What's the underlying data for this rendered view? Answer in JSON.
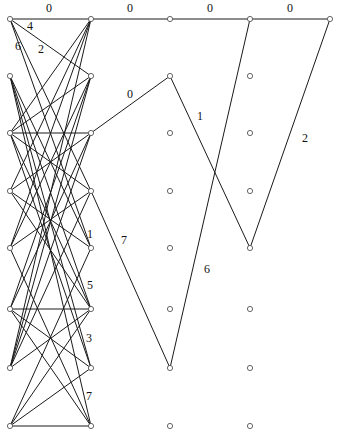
{
  "diagram": {
    "type": "layered-graph",
    "nodes": [
      {
        "id": "L0",
        "x": 10,
        "y": 19
      },
      {
        "id": "L1",
        "x": 10,
        "y": 76
      },
      {
        "id": "L2",
        "x": 10,
        "y": 133
      },
      {
        "id": "L3",
        "x": 10,
        "y": 191
      },
      {
        "id": "L4",
        "x": 10,
        "y": 248
      },
      {
        "id": "L5",
        "x": 10,
        "y": 309
      },
      {
        "id": "L6",
        "x": 10,
        "y": 368
      },
      {
        "id": "L7",
        "x": 10,
        "y": 426
      },
      {
        "id": "R0",
        "x": 91,
        "y": 19
      },
      {
        "id": "R1",
        "x": 91,
        "y": 76
      },
      {
        "id": "R2",
        "x": 91,
        "y": 133
      },
      {
        "id": "R3",
        "x": 91,
        "y": 191
      },
      {
        "id": "R4",
        "x": 91,
        "y": 248
      },
      {
        "id": "R5",
        "x": 91,
        "y": 309
      },
      {
        "id": "R6",
        "x": 91,
        "y": 368
      },
      {
        "id": "R7",
        "x": 91,
        "y": 426
      },
      {
        "id": "C0",
        "x": 170,
        "y": 19
      },
      {
        "id": "C1",
        "x": 170,
        "y": 76
      },
      {
        "id": "C2",
        "x": 170,
        "y": 133
      },
      {
        "id": "C3",
        "x": 170,
        "y": 191
      },
      {
        "id": "C4",
        "x": 170,
        "y": 248
      },
      {
        "id": "C5",
        "x": 170,
        "y": 309
      },
      {
        "id": "C6",
        "x": 170,
        "y": 368
      },
      {
        "id": "C7",
        "x": 170,
        "y": 426
      },
      {
        "id": "D0",
        "x": 250,
        "y": 19
      },
      {
        "id": "D1",
        "x": 250,
        "y": 76
      },
      {
        "id": "D2",
        "x": 250,
        "y": 133
      },
      {
        "id": "D3",
        "x": 250,
        "y": 191
      },
      {
        "id": "D4",
        "x": 250,
        "y": 248
      },
      {
        "id": "D5",
        "x": 250,
        "y": 309
      },
      {
        "id": "D6",
        "x": 250,
        "y": 368
      },
      {
        "id": "D7",
        "x": 250,
        "y": 426
      },
      {
        "id": "E0",
        "x": 330,
        "y": 19
      }
    ],
    "edges": [
      [
        "L0",
        "R0"
      ],
      [
        "L0",
        "R1"
      ],
      [
        "L0",
        "R3"
      ],
      [
        "L0",
        "R4"
      ],
      [
        "L1",
        "R4"
      ],
      [
        "L1",
        "R5"
      ],
      [
        "L1",
        "R6"
      ],
      [
        "L1",
        "R7"
      ],
      [
        "L2",
        "R0"
      ],
      [
        "L2",
        "R1"
      ],
      [
        "L2",
        "R2"
      ],
      [
        "L2",
        "R3"
      ],
      [
        "L2",
        "R5"
      ],
      [
        "L2",
        "R6"
      ],
      [
        "L3",
        "R0"
      ],
      [
        "L3",
        "R2"
      ],
      [
        "L3",
        "R4"
      ],
      [
        "L3",
        "R5"
      ],
      [
        "L4",
        "R0"
      ],
      [
        "L4",
        "R1"
      ],
      [
        "L4",
        "R3"
      ],
      [
        "L4",
        "R7"
      ],
      [
        "L5",
        "R1"
      ],
      [
        "L5",
        "R2"
      ],
      [
        "L5",
        "R5"
      ],
      [
        "L5",
        "R6"
      ],
      [
        "L5",
        "R7"
      ],
      [
        "L6",
        "R0"
      ],
      [
        "L6",
        "R1"
      ],
      [
        "L6",
        "R2"
      ],
      [
        "L6",
        "R3"
      ],
      [
        "L6",
        "R5"
      ],
      [
        "L7",
        "R4"
      ],
      [
        "L7",
        "R5"
      ],
      [
        "L7",
        "R6"
      ],
      [
        "L7",
        "R7"
      ],
      [
        "R0",
        "C0"
      ],
      [
        "C0",
        "D0"
      ],
      [
        "D0",
        "E0"
      ],
      [
        "R2",
        "C1"
      ],
      [
        "C1",
        "D4"
      ],
      [
        "D4",
        "E0"
      ],
      [
        "D0",
        "C6"
      ],
      [
        "R3",
        "C6"
      ]
    ],
    "labels": [
      {
        "text": "0",
        "x": 46,
        "y": 12
      },
      {
        "text": "0",
        "x": 127,
        "y": 12
      },
      {
        "text": "0",
        "x": 207,
        "y": 12
      },
      {
        "text": "0",
        "x": 287,
        "y": 12
      },
      {
        "text": "4",
        "x": 27,
        "y": 30
      },
      {
        "text": "6",
        "x": 15,
        "y": 50
      },
      {
        "text": "2",
        "x": 38,
        "y": 53
      },
      {
        "text": "0",
        "x": 127,
        "y": 98
      },
      {
        "text": "1",
        "x": 197,
        "y": 120
      },
      {
        "text": "2",
        "x": 302,
        "y": 142
      },
      {
        "text": "1",
        "x": 87,
        "y": 238
      },
      {
        "text": "7",
        "x": 121,
        "y": 244
      },
      {
        "text": "6",
        "x": 204,
        "y": 273
      },
      {
        "text": "5",
        "x": 87,
        "y": 289
      },
      {
        "text": "3",
        "x": 86,
        "y": 342
      },
      {
        "text": "7",
        "x": 86,
        "y": 400
      }
    ]
  }
}
